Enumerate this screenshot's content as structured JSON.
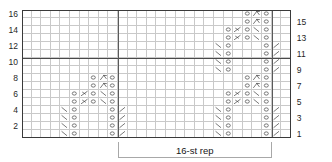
{
  "chart": {
    "columns": 28,
    "rows": 16,
    "cell_width": 9.6,
    "cell_height": 8.0,
    "grid_line_color": "#c9c9c9",
    "border_color": "#3a3a3a",
    "bold_line_color": "#4a4a4a",
    "background": "#ffffff"
  },
  "row_labels": {
    "left": [
      "16",
      "14",
      "12",
      "10",
      "8",
      "6",
      "4",
      "2"
    ],
    "left_rows": [
      16,
      14,
      12,
      10,
      8,
      6,
      4,
      2
    ],
    "right": [
      "15",
      "13",
      "11",
      "9",
      "7",
      "5",
      "3",
      "1"
    ],
    "right_rows": [
      15,
      13,
      11,
      9,
      7,
      5,
      3,
      1
    ]
  },
  "repeat": {
    "label": "16-st rep",
    "stitch_count": 16,
    "start_col": 11,
    "end_col": 26
  },
  "bold_lines": {
    "horizontal_after_row": 10,
    "vertical_cols": [
      10,
      26
    ]
  },
  "symbol_legend": {
    "O": "yarn-over",
    "\\": "ssk-left-leaning-decrease",
    "/": "k2tog-right-leaning-decrease",
    "A": "central-double-decrease",
    "F": "sl1-k2tog-psso-decrease"
  },
  "chart_data": {
    "type": "heatmap",
    "xlabel": "",
    "ylabel": "",
    "columns": 28,
    "rows": 16,
    "legend": [
      {
        "symbol": "O",
        "name": "yarn over"
      },
      {
        "symbol": "\\",
        "name": "ssk"
      },
      {
        "symbol": "/",
        "name": "k2tog"
      },
      {
        "symbol": "A",
        "name": "central double decrease"
      },
      {
        "symbol": "F",
        "name": "sl1-k2tog-psso"
      }
    ],
    "cells": [
      {
        "row": 16,
        "col": 24,
        "symbol": "O"
      },
      {
        "row": 16,
        "col": 25,
        "symbol": "A"
      },
      {
        "row": 16,
        "col": 26,
        "symbol": "O"
      },
      {
        "row": 15,
        "col": 24,
        "symbol": "O"
      },
      {
        "row": 15,
        "col": 25,
        "symbol": "A"
      },
      {
        "row": 15,
        "col": 26,
        "symbol": "O"
      },
      {
        "row": 14,
        "col": 22,
        "symbol": "O"
      },
      {
        "row": 14,
        "col": 23,
        "symbol": "F"
      },
      {
        "row": 14,
        "col": 24,
        "symbol": "O"
      },
      {
        "row": 14,
        "col": 25,
        "symbol": "\\"
      },
      {
        "row": 14,
        "col": 26,
        "symbol": "O"
      },
      {
        "row": 13,
        "col": 22,
        "symbol": "O"
      },
      {
        "row": 13,
        "col": 23,
        "symbol": "F"
      },
      {
        "row": 13,
        "col": 24,
        "symbol": "O"
      },
      {
        "row": 13,
        "col": 25,
        "symbol": "\\"
      },
      {
        "row": 13,
        "col": 26,
        "symbol": "O"
      },
      {
        "row": 12,
        "col": 21,
        "symbol": "\\"
      },
      {
        "row": 12,
        "col": 22,
        "symbol": "O"
      },
      {
        "row": 12,
        "col": 26,
        "symbol": "O"
      },
      {
        "row": 12,
        "col": 27,
        "symbol": "/"
      },
      {
        "row": 11,
        "col": 21,
        "symbol": "\\"
      },
      {
        "row": 11,
        "col": 22,
        "symbol": "O"
      },
      {
        "row": 11,
        "col": 26,
        "symbol": "O"
      },
      {
        "row": 11,
        "col": 27,
        "symbol": "/"
      },
      {
        "row": 10,
        "col": 21,
        "symbol": "\\"
      },
      {
        "row": 10,
        "col": 22,
        "symbol": "O"
      },
      {
        "row": 10,
        "col": 26,
        "symbol": "O"
      },
      {
        "row": 10,
        "col": 27,
        "symbol": "/"
      },
      {
        "row": 9,
        "col": 21,
        "symbol": "\\"
      },
      {
        "row": 9,
        "col": 22,
        "symbol": "O"
      },
      {
        "row": 9,
        "col": 26,
        "symbol": "O"
      },
      {
        "row": 9,
        "col": 27,
        "symbol": "/"
      },
      {
        "row": 8,
        "col": 8,
        "symbol": "O"
      },
      {
        "row": 8,
        "col": 9,
        "symbol": "A"
      },
      {
        "row": 8,
        "col": 10,
        "symbol": "O"
      },
      {
        "row": 8,
        "col": 24,
        "symbol": "O"
      },
      {
        "row": 8,
        "col": 25,
        "symbol": "A"
      },
      {
        "row": 8,
        "col": 26,
        "symbol": "O"
      },
      {
        "row": 7,
        "col": 8,
        "symbol": "O"
      },
      {
        "row": 7,
        "col": 9,
        "symbol": "A"
      },
      {
        "row": 7,
        "col": 10,
        "symbol": "O"
      },
      {
        "row": 7,
        "col": 24,
        "symbol": "O"
      },
      {
        "row": 7,
        "col": 25,
        "symbol": "A"
      },
      {
        "row": 7,
        "col": 26,
        "symbol": "O"
      },
      {
        "row": 6,
        "col": 6,
        "symbol": "O"
      },
      {
        "row": 6,
        "col": 7,
        "symbol": "F"
      },
      {
        "row": 6,
        "col": 8,
        "symbol": "O"
      },
      {
        "row": 6,
        "col": 9,
        "symbol": "\\"
      },
      {
        "row": 6,
        "col": 10,
        "symbol": "O"
      },
      {
        "row": 6,
        "col": 22,
        "symbol": "O"
      },
      {
        "row": 6,
        "col": 23,
        "symbol": "F"
      },
      {
        "row": 6,
        "col": 24,
        "symbol": "O"
      },
      {
        "row": 6,
        "col": 25,
        "symbol": "\\"
      },
      {
        "row": 6,
        "col": 26,
        "symbol": "O"
      },
      {
        "row": 5,
        "col": 6,
        "symbol": "O"
      },
      {
        "row": 5,
        "col": 7,
        "symbol": "F"
      },
      {
        "row": 5,
        "col": 8,
        "symbol": "O"
      },
      {
        "row": 5,
        "col": 9,
        "symbol": "\\"
      },
      {
        "row": 5,
        "col": 10,
        "symbol": "O"
      },
      {
        "row": 5,
        "col": 22,
        "symbol": "O"
      },
      {
        "row": 5,
        "col": 23,
        "symbol": "F"
      },
      {
        "row": 5,
        "col": 24,
        "symbol": "O"
      },
      {
        "row": 5,
        "col": 25,
        "symbol": "\\"
      },
      {
        "row": 5,
        "col": 26,
        "symbol": "O"
      },
      {
        "row": 4,
        "col": 5,
        "symbol": "\\"
      },
      {
        "row": 4,
        "col": 6,
        "symbol": "O"
      },
      {
        "row": 4,
        "col": 10,
        "symbol": "O"
      },
      {
        "row": 4,
        "col": 11,
        "symbol": "/"
      },
      {
        "row": 4,
        "col": 21,
        "symbol": "\\"
      },
      {
        "row": 4,
        "col": 22,
        "symbol": "O"
      },
      {
        "row": 4,
        "col": 26,
        "symbol": "O"
      },
      {
        "row": 4,
        "col": 27,
        "symbol": "/"
      },
      {
        "row": 3,
        "col": 5,
        "symbol": "\\"
      },
      {
        "row": 3,
        "col": 6,
        "symbol": "O"
      },
      {
        "row": 3,
        "col": 10,
        "symbol": "O"
      },
      {
        "row": 3,
        "col": 11,
        "symbol": "/"
      },
      {
        "row": 3,
        "col": 21,
        "symbol": "\\"
      },
      {
        "row": 3,
        "col": 22,
        "symbol": "O"
      },
      {
        "row": 3,
        "col": 26,
        "symbol": "O"
      },
      {
        "row": 3,
        "col": 27,
        "symbol": "/"
      },
      {
        "row": 2,
        "col": 5,
        "symbol": "\\"
      },
      {
        "row": 2,
        "col": 6,
        "symbol": "O"
      },
      {
        "row": 2,
        "col": 10,
        "symbol": "O"
      },
      {
        "row": 2,
        "col": 11,
        "symbol": "/"
      },
      {
        "row": 2,
        "col": 21,
        "symbol": "\\"
      },
      {
        "row": 2,
        "col": 22,
        "symbol": "O"
      },
      {
        "row": 2,
        "col": 26,
        "symbol": "O"
      },
      {
        "row": 2,
        "col": 27,
        "symbol": "/"
      },
      {
        "row": 1,
        "col": 5,
        "symbol": "\\"
      },
      {
        "row": 1,
        "col": 6,
        "symbol": "O"
      },
      {
        "row": 1,
        "col": 10,
        "symbol": "O"
      },
      {
        "row": 1,
        "col": 11,
        "symbol": "/"
      },
      {
        "row": 1,
        "col": 21,
        "symbol": "\\"
      },
      {
        "row": 1,
        "col": 22,
        "symbol": "O"
      },
      {
        "row": 1,
        "col": 26,
        "symbol": "O"
      },
      {
        "row": 1,
        "col": 27,
        "symbol": "/"
      }
    ]
  }
}
